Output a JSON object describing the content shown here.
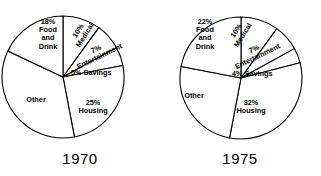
{
  "chart_data": [
    {
      "type": "pie",
      "title": "1970",
      "categories": [
        "Medical",
        "Entertainment",
        "Savings",
        "Housing",
        "Other",
        "Food and Drink"
      ],
      "values": [
        10,
        7,
        5,
        25,
        35,
        18
      ],
      "labels": [
        {
          "text": "10%\nMedical",
          "percent": "10%",
          "name": "Medical"
        },
        {
          "text": "7%\nEntertainment",
          "percent": "7%",
          "name": "Entertainment"
        },
        {
          "text": "5% Savings",
          "percent": "5%",
          "name": "Savings"
        },
        {
          "text": "25%\nHousing",
          "percent": "25%",
          "name": "Housing"
        },
        {
          "text": "Other",
          "percent": "",
          "name": "Other"
        },
        {
          "text": "18%\nFood\nand\nDrink",
          "percent": "18%",
          "name": "Food and Drink"
        }
      ],
      "startangle": 90,
      "direction": "clockwise",
      "legend": "none",
      "grid": false
    },
    {
      "type": "pie",
      "title": "1975",
      "categories": [
        "Medical",
        "Entertainment",
        "Savings",
        "Housing",
        "Other",
        "Food and Drink"
      ],
      "values": [
        10,
        7,
        4,
        32,
        25,
        22
      ],
      "labels": [
        {
          "text": "10%\nMedical",
          "percent": "10%",
          "name": "Medical"
        },
        {
          "text": "7%\nEntertainment",
          "percent": "7%",
          "name": "Entertainment"
        },
        {
          "text": "4% Savings",
          "percent": "4%",
          "name": "Savings"
        },
        {
          "text": "32%\nHousing",
          "percent": "32%",
          "name": "Housing"
        },
        {
          "text": "Other",
          "percent": "",
          "name": "Other"
        },
        {
          "text": "22%\nFood\nand\nDrink",
          "percent": "22%",
          "name": "Food and Drink"
        }
      ],
      "startangle": 90,
      "direction": "clockwise",
      "legend": "none",
      "grid": false
    }
  ],
  "charts": [
    {
      "year": "1970",
      "food_label": "18%\nFood\nand\nDrink",
      "medical_label": "10%\nMedical",
      "entertainment_label": "7%\nEntertainment",
      "savings_label": "5% Savings",
      "housing_label": "25%\nHousing",
      "other_label": "Other"
    },
    {
      "year": "1975",
      "food_label": "22%\nFood\nand\nDrink",
      "medical_label": "10%\nMedical",
      "entertainment_label": "7%\nEntertainment",
      "savings_label": "4% Savings",
      "housing_label": "32%\nHousing",
      "other_label": "Other"
    }
  ],
  "style": {
    "stroke_color": "#000000",
    "fill_color": "#ffffff",
    "background": "#ffffff"
  }
}
